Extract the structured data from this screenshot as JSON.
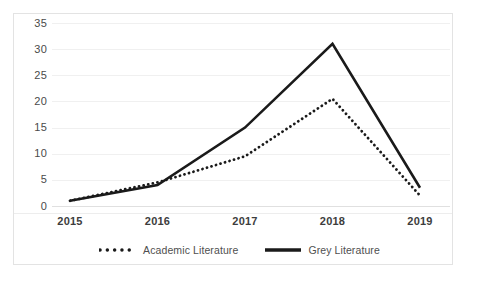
{
  "chart_data": {
    "type": "line",
    "title": "",
    "xlabel": "",
    "ylabel": "",
    "categories": [
      "2015",
      "2016",
      "2017",
      "2018",
      "2019"
    ],
    "x": [
      2015,
      2016,
      2017,
      2018,
      2019
    ],
    "ylim": [
      0,
      35
    ],
    "xlim": [
      "2015",
      "2019"
    ],
    "yticks": [
      "0",
      "5",
      "10",
      "15",
      "20",
      "25",
      "30",
      "35"
    ],
    "ytick_values": [
      0,
      5,
      10,
      15,
      20,
      25,
      30,
      35
    ],
    "grid": "horizontal",
    "legend_position": "bottom-center",
    "series": [
      {
        "name": "Academic Literature",
        "style": "dotted",
        "color": "#1a1a1a",
        "values": [
          1,
          4.5,
          9.5,
          20.5,
          2
        ]
      },
      {
        "name": "Grey Literature",
        "style": "solid",
        "color": "#1a1a1a",
        "values": [
          1,
          4,
          15,
          31,
          3.5
        ]
      }
    ]
  },
  "legend": {
    "items": [
      {
        "label": "Academic Literature",
        "swatch": "dotted-line-swatch"
      },
      {
        "label": "Grey Literature",
        "swatch": "solid-line-swatch"
      }
    ]
  },
  "colors": {
    "series": "#1a1a1a",
    "gridline": "#f0f0f0",
    "frame": "#e3e3e3",
    "axis_text": "#4a4a4a",
    "background": "#ffffff"
  }
}
